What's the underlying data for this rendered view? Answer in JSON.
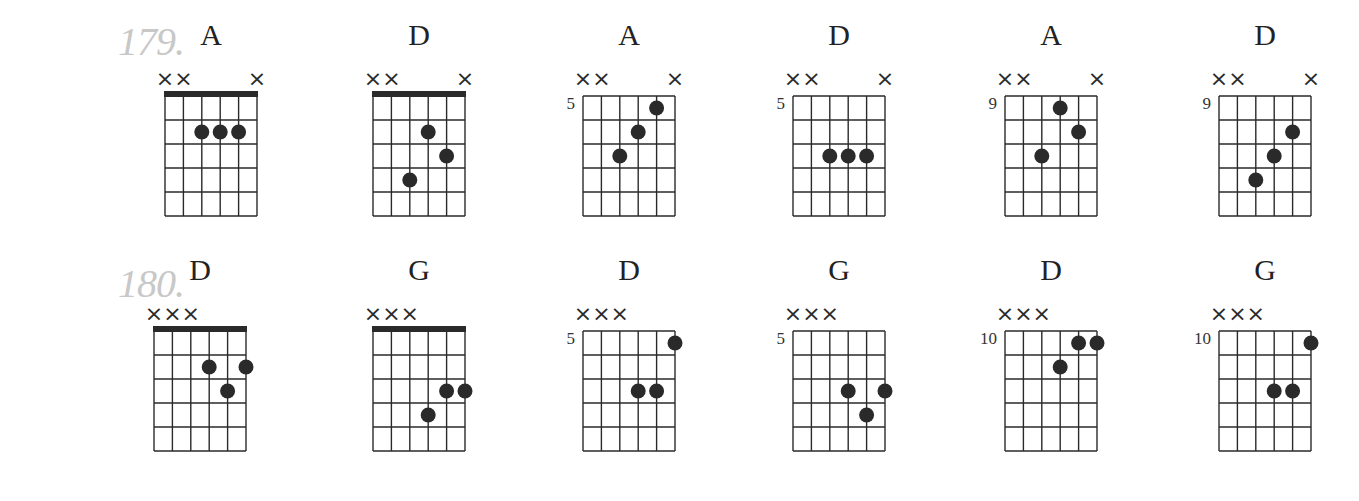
{
  "exercises": [
    {
      "number": "179.",
      "chords": [
        {
          "name": "A",
          "fret_label": "",
          "nut": true,
          "muted": [
            0,
            1,
            5
          ],
          "dots": [
            [
              2,
              2
            ],
            [
              3,
              2
            ],
            [
              4,
              2
            ]
          ]
        },
        {
          "name": "D",
          "fret_label": "",
          "nut": true,
          "muted": [
            0,
            1,
            5
          ],
          "dots": [
            [
              3,
              2
            ],
            [
              4,
              3
            ],
            [
              2,
              4
            ]
          ]
        },
        {
          "name": "A",
          "fret_label": "5",
          "nut": false,
          "muted": [
            0,
            1,
            5
          ],
          "dots": [
            [
              4,
              1
            ],
            [
              3,
              2
            ],
            [
              2,
              3
            ]
          ]
        },
        {
          "name": "D",
          "fret_label": "5",
          "nut": false,
          "muted": [
            0,
            1,
            5
          ],
          "dots": [
            [
              2,
              3
            ],
            [
              3,
              3
            ],
            [
              4,
              3
            ]
          ]
        },
        {
          "name": "A",
          "fret_label": "9",
          "nut": false,
          "muted": [
            0,
            1,
            5
          ],
          "dots": [
            [
              3,
              1
            ],
            [
              4,
              2
            ],
            [
              2,
              3
            ]
          ]
        },
        {
          "name": "D",
          "fret_label": "9",
          "nut": false,
          "muted": [
            0,
            1,
            5
          ],
          "dots": [
            [
              4,
              2
            ],
            [
              3,
              3
            ],
            [
              2,
              4
            ]
          ]
        }
      ]
    },
    {
      "number": "180.",
      "chords": [
        {
          "name": "D",
          "fret_label": "",
          "nut": true,
          "muted": [
            0,
            1,
            2
          ],
          "dots": [
            [
              3,
              2
            ],
            [
              5,
              2
            ],
            [
              4,
              3
            ]
          ]
        },
        {
          "name": "G",
          "fret_label": "",
          "nut": true,
          "muted": [
            0,
            1,
            2
          ],
          "dots": [
            [
              4,
              3
            ],
            [
              5,
              3
            ],
            [
              3,
              4
            ]
          ]
        },
        {
          "name": "D",
          "fret_label": "5",
          "nut": false,
          "muted": [
            0,
            1,
            2
          ],
          "dots": [
            [
              5,
              1
            ],
            [
              3,
              3
            ],
            [
              4,
              3
            ]
          ]
        },
        {
          "name": "G",
          "fret_label": "5",
          "nut": false,
          "muted": [
            0,
            1,
            2
          ],
          "dots": [
            [
              3,
              3
            ],
            [
              5,
              3
            ],
            [
              4,
              4
            ]
          ]
        },
        {
          "name": "D",
          "fret_label": "10",
          "nut": false,
          "muted": [
            0,
            1,
            2
          ],
          "dots": [
            [
              4,
              1
            ],
            [
              5,
              1
            ],
            [
              3,
              2
            ]
          ]
        },
        {
          "name": "G",
          "fret_label": "10",
          "nut": false,
          "muted": [
            0,
            1,
            2
          ],
          "dots": [
            [
              5,
              1
            ],
            [
              3,
              3
            ],
            [
              4,
              3
            ]
          ]
        }
      ]
    }
  ],
  "symbols": {
    "muted": "×"
  },
  "colors": {
    "ink": "#2a2a2a",
    "exercise_number": "#c8c8c8"
  }
}
